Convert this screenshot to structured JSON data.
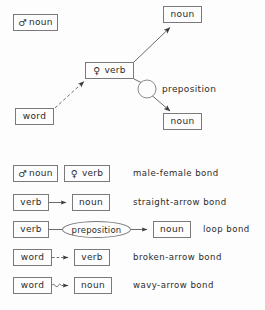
{
  "figure": {
    "background_color": "#fdfdfd",
    "stroke_color": "#5a5a5a",
    "box_border_color": "#7a7a7a",
    "text_color": "#2b2b2b"
  },
  "diagram": {
    "nodes": [
      {
        "id": "male-noun",
        "symbol": "♂",
        "label": "noun",
        "x": 13,
        "y": 14,
        "w": 45,
        "h": 17
      },
      {
        "id": "female-verb",
        "symbol": "♀",
        "label": "verb",
        "x": 85,
        "y": 62,
        "w": 49,
        "h": 17
      },
      {
        "id": "noun-top-right",
        "symbol": "",
        "label": "noun",
        "x": 163,
        "y": 6,
        "w": 39,
        "h": 17
      },
      {
        "id": "word-left",
        "symbol": "",
        "label": "word",
        "x": 15,
        "y": 108,
        "w": 39,
        "h": 17
      },
      {
        "id": "noun-bottom",
        "symbol": "",
        "label": "noun",
        "x": 163,
        "y": 113,
        "w": 39,
        "h": 17
      }
    ],
    "circle": {
      "id": "loop-circle",
      "cx": 147,
      "cy": 89,
      "r": 9
    },
    "preposition_label": "preposition",
    "edges": [
      {
        "id": "verb-to-noun-top-right",
        "type": "straight-arrow"
      },
      {
        "id": "word-to-verb",
        "type": "broken-arrow"
      },
      {
        "id": "verb-to-circle",
        "type": "loop-line"
      },
      {
        "id": "circle-to-noun-bottom",
        "type": "straight-arrow"
      }
    ]
  },
  "legend": {
    "rows": [
      {
        "id": "male-female-bond",
        "description": "male-female bond",
        "kind": "pair",
        "boxes": [
          {
            "symbol": "♂",
            "label": "noun"
          },
          {
            "symbol": "♀",
            "label": "verb"
          }
        ]
      },
      {
        "id": "straight-arrow-bond",
        "description": "straight-arrow bond",
        "kind": "straight-arrow",
        "from_label": "verb",
        "to_label": "noun"
      },
      {
        "id": "loop-bond",
        "description": "loop bond",
        "kind": "loop",
        "from_label": "verb",
        "middle_label": "preposition",
        "to_label": "noun"
      },
      {
        "id": "broken-arrow-bond",
        "description": "broken-arrow bond",
        "kind": "broken-arrow",
        "from_label": "word",
        "to_label": "verb"
      },
      {
        "id": "wavy-arrow-bond",
        "description": "wavy-arrow bond",
        "kind": "wavy-arrow",
        "from_label": "word",
        "to_label": "noun"
      }
    ]
  }
}
